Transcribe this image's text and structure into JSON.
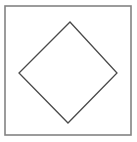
{
  "figure": {
    "canvas": {
      "width": 137,
      "height": 142,
      "background_color": "#ffffff"
    },
    "shapes": [
      {
        "id": "outer-frame",
        "name": "outer-square-frame",
        "kind": "rectangle",
        "x": 5,
        "y": 6,
        "width": 126,
        "height": 129,
        "stroke_color": "#838383",
        "stroke_width": 1.6,
        "fill_color": "#ffffff"
      },
      {
        "id": "inner-diamond",
        "name": "inscribed-diamond",
        "kind": "polygon",
        "points": "70,22 117,73 68,123 19,73",
        "vertices": [
          {
            "label": "top",
            "x": 70,
            "y": 22
          },
          {
            "label": "right",
            "x": 117,
            "y": 73
          },
          {
            "label": "bottom",
            "x": 68,
            "y": 123
          },
          {
            "label": "left",
            "x": 19,
            "y": 73
          }
        ],
        "stroke_color": "#4a4a4a",
        "stroke_width": 1.3,
        "fill_color": "none"
      }
    ]
  }
}
